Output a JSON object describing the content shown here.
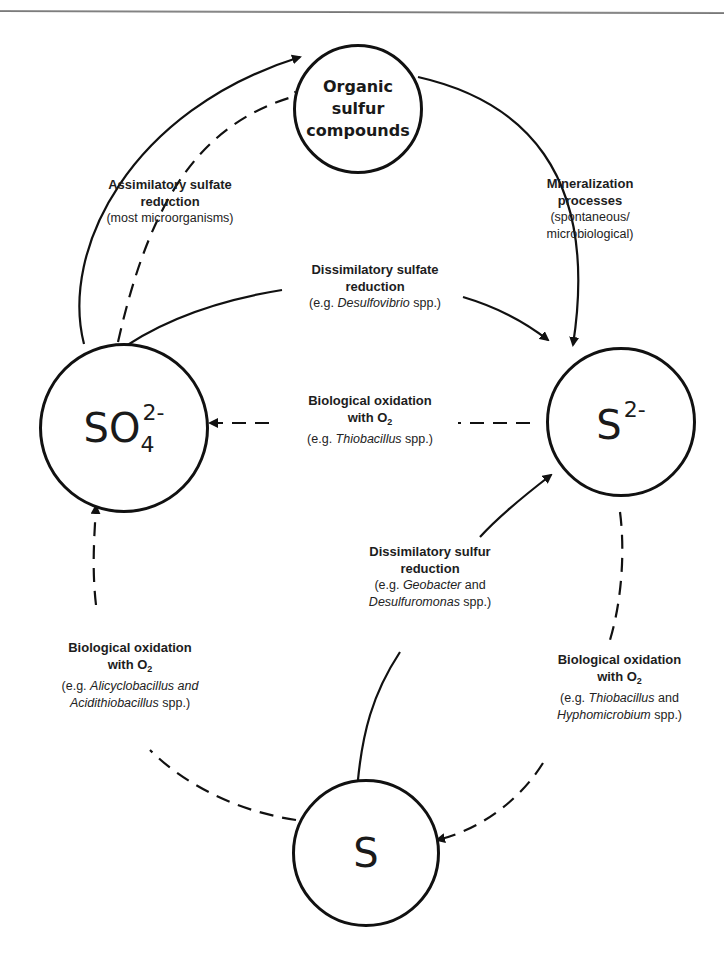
{
  "header": {
    "partial_title": "...sphere"
  },
  "nodes": {
    "organic": {
      "line1": "Organic sulfur",
      "line2": "compounds"
    },
    "sulfate": {
      "base": "SO",
      "sub": "4",
      "sup": "2-"
    },
    "sulfide": {
      "base": "S",
      "sup": "2-"
    },
    "sulfur": {
      "base": "S"
    }
  },
  "processes": {
    "assimilatory": {
      "title1": "Assimilatory sulfate",
      "title2": "reduction",
      "example": "(most microorganisms)"
    },
    "mineralization": {
      "title1": "Mineralization",
      "title2": "processes",
      "example1": "(spontaneous/",
      "example2": "microbiological)"
    },
    "dissimilatory_sulfate": {
      "title1": "Dissimilatory sulfate",
      "title2": "reduction",
      "ex_prefix": "(e.g. ",
      "ex_organism": "Desulfovibrio",
      "ex_suffix": " spp.)"
    },
    "oxidation_sulfide": {
      "title1": "Biological oxidation",
      "title2_prefix": "with O",
      "title2_sub": "2",
      "ex_prefix": "(e.g. ",
      "ex_organism": "Thiobacillus",
      "ex_suffix": " spp.)"
    },
    "dissimilatory_sulfur": {
      "title1": "Dissimilatory sulfur",
      "title2": "reduction",
      "ex_prefix": "(e.g. ",
      "ex_organism1": "Geobacter",
      "ex_and": " and",
      "ex_organism2": "Desulfuromonas",
      "ex_suffix": " spp.)"
    },
    "oxidation_sulfur_left": {
      "title1": "Biological oxidation",
      "title2_prefix": "with O",
      "title2_sub": "2",
      "ex_prefix": "(e.g. ",
      "ex_organism1": "Alicyclobacillus and",
      "ex_organism2": "Acidithiobacillus",
      "ex_suffix": " spp.)"
    },
    "oxidation_sulfide_right": {
      "title1": "Biological oxidation",
      "title2_prefix": "with O",
      "title2_sub": "2",
      "ex_prefix": "(e.g. ",
      "ex_organism1": "Thiobacillus",
      "ex_and": " and",
      "ex_organism2": "Hyphomicrobium",
      "ex_suffix": " spp.)"
    }
  },
  "legend": {
    "solid_line": "reduction / transformation pathway",
    "dashed_line": "oxidation pathway"
  },
  "colors": {
    "line": "#111111",
    "text": "#1a1a1a",
    "rule": "#7a7a7a"
  }
}
